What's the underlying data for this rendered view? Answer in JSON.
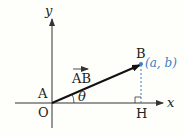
{
  "diagram": {
    "axis_x_label": "x",
    "axis_y_label": "y",
    "point_A": "A",
    "point_O": "O",
    "point_B": "B",
    "point_H": "H",
    "vector_label": "AB",
    "angle_label": "θ",
    "coord_label": "(a, b)",
    "colors": {
      "axis": "#333333",
      "vector": "#111111",
      "coord": "#3a7fc4",
      "dashed": "#3a7fc4"
    }
  }
}
